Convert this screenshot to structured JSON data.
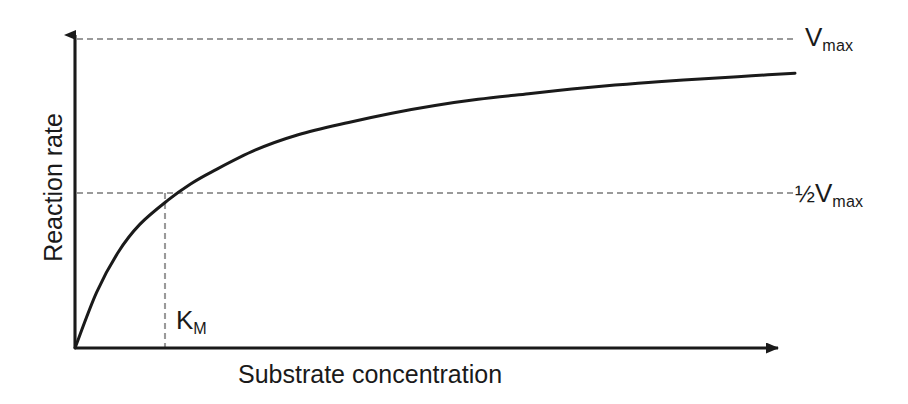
{
  "chart_data": {
    "type": "line",
    "title": "",
    "subtitle": "",
    "xlabel": "Substrate concentration",
    "ylabel": "Reaction rate",
    "grid": false,
    "legend": "none",
    "axes": {
      "x_arrow": true,
      "y_arrow": true,
      "x_ticks": [],
      "y_ticks": [],
      "xlim": [
        0,
        1
      ],
      "ylim": [
        0,
        1
      ]
    },
    "curve": {
      "name": "Michaelis-Menten saturation curve",
      "equation": "v = Vmax * [S] / (KM + [S])",
      "color": "#1a1a1a",
      "x": [
        0.0,
        0.03,
        0.06,
        0.09,
        0.13,
        0.16,
        0.19,
        0.25,
        0.31,
        0.38,
        0.44,
        0.5,
        0.56,
        0.63,
        0.69,
        0.75,
        0.81,
        0.88,
        0.94,
        1.0
      ],
      "y": [
        0.0,
        0.18,
        0.31,
        0.4,
        0.48,
        0.53,
        0.57,
        0.64,
        0.69,
        0.73,
        0.76,
        0.785,
        0.805,
        0.823,
        0.838,
        0.851,
        0.862,
        0.872,
        0.881,
        0.889
      ]
    },
    "annotations": [
      {
        "name": "vmax-asymptote",
        "type": "hline",
        "y": 1.0,
        "style": "dashed",
        "color": "#9a9a9a",
        "label": "Vmax"
      },
      {
        "name": "half-vmax-line",
        "type": "hline",
        "y": 0.5,
        "style": "dashed",
        "color": "#9a9a9a",
        "label": "1/2 Vmax"
      },
      {
        "name": "km-line",
        "type": "vline",
        "x": 0.123,
        "style": "dashed",
        "color": "#9a9a9a",
        "label": "KM"
      }
    ]
  },
  "labels": {
    "y_axis": "Reaction rate",
    "x_axis": "Substrate concentration",
    "vmax_base": "V",
    "vmax_sub": "max",
    "half_fraction": "½",
    "half_vmax_base": "V",
    "half_vmax_sub": "max",
    "km_base": "K",
    "km_sub": "M"
  },
  "colors": {
    "curve": "#1a1a1a",
    "axis": "#1a1a1a",
    "dashed": "#9a9a9a",
    "text": "#1a1a1a",
    "background": "#ffffff"
  }
}
